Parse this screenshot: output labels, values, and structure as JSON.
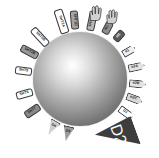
{
  "figure": {
    "center": {
      "name": "drug-molecule-sphere",
      "label": ""
    },
    "colors": {
      "outline": "#3a3a3a",
      "text": "#1a1a1a",
      "fill_white": "#ffffff",
      "fill_light": "#e8e8e8",
      "fill_mid": "#bdbdbd",
      "fill_dark": "#8f8f8f",
      "fill_darker": "#6e6e6e",
      "fill_black": "#4a4a4a",
      "sphere_center": "#ffffff",
      "sphere_edge": "#4a4a4a",
      "background": "#ffffff"
    },
    "receptors": [
      {
        "id": "r1",
        "label": "5HT2A",
        "shape": "tag",
        "fill": "#ffffff",
        "angle": -108,
        "dist": 60,
        "w": 25,
        "h": 9
      },
      {
        "id": "r2",
        "label": "5HT1A",
        "shape": "tag",
        "fill": "#b9b9b9",
        "angle": -78,
        "dist": 59,
        "w": 20,
        "h": 8
      },
      {
        "id": "r3",
        "label": "5HT1D",
        "shape": "tag",
        "fill": "#a3a3a3",
        "angle": -95,
        "dist": 59,
        "w": 19,
        "h": 8
      },
      {
        "id": "r4",
        "label": "M1",
        "shape": "tag",
        "fill": "#8f8f8f",
        "angle": -62,
        "dist": 58,
        "w": 13,
        "h": 8
      },
      {
        "id": "r5",
        "label": "H1",
        "shape": "tag",
        "fill": "#5a5a5a",
        "angle": -48,
        "dist": 58,
        "w": 12,
        "h": 8
      },
      {
        "id": "r6",
        "label": "5HT3B",
        "shape": "tag",
        "fill": "#ffffff",
        "angle": -133,
        "dist": 58,
        "w": 22,
        "h": 8
      },
      {
        "id": "r7",
        "label": "5HT2B",
        "shape": "tag",
        "fill": "#9a9a9a",
        "angle": -152,
        "dist": 57,
        "w": 19,
        "h": 8
      },
      {
        "id": "r8",
        "label": "5HT5",
        "shape": "tag",
        "fill": "#ffffff",
        "angle": -172,
        "dist": 57,
        "w": 17,
        "h": 8
      },
      {
        "id": "r9",
        "label": "5HT6",
        "shape": "tag",
        "fill": "#ffffff",
        "angle": 165,
        "dist": 57,
        "w": 17,
        "h": 8
      },
      {
        "id": "r10",
        "label": "5HT7",
        "shape": "tag",
        "fill": "#8a8a8a",
        "angle": 146,
        "dist": 57,
        "w": 17,
        "h": 8
      },
      {
        "id": "r11",
        "label": "D4",
        "shape": "spike",
        "fill": "#cfcfcf",
        "angle": 120,
        "dist": 56,
        "w": 11,
        "h": 15
      },
      {
        "id": "r12",
        "label": "D3",
        "shape": "spike",
        "fill": "#9d9d9d",
        "angle": 103,
        "dist": 56,
        "w": 11,
        "h": 15
      },
      {
        "id": "r13",
        "label": "D2",
        "shape": "bigtri",
        "fill": "#3d3d3d",
        "angle": 60,
        "dist": 62,
        "w": 30,
        "h": 40
      },
      {
        "id": "r14",
        "label": "D1",
        "shape": "arrow",
        "fill": "#ffffff",
        "angle": 36,
        "dist": 57,
        "w": 16,
        "h": 8
      },
      {
        "id": "r15",
        "label": "α2C",
        "shape": "arrow",
        "fill": "#d9d9d9",
        "angle": 20,
        "dist": 58,
        "w": 17,
        "h": 8
      },
      {
        "id": "r16",
        "label": "α2B",
        "shape": "arrow",
        "fill": "#e3e3e3",
        "angle": 5,
        "dist": 58,
        "w": 17,
        "h": 8
      },
      {
        "id": "r17",
        "label": "α2A",
        "shape": "arrow",
        "fill": "#e3e3e3",
        "angle": -12,
        "dist": 58,
        "w": 17,
        "h": 8
      },
      {
        "id": "r18",
        "label": "α1",
        "shape": "arrow",
        "fill": "#f0f0f0",
        "angle": -30,
        "dist": 57,
        "w": 14,
        "h": 8
      }
    ],
    "activation_icons": [
      {
        "id": "h1",
        "name": "hand-activation-icon-left",
        "x": 88,
        "y": 5,
        "w": 14,
        "h": 16,
        "fill": "#d0d0d0"
      },
      {
        "id": "h2",
        "name": "hand-activation-icon-right",
        "x": 105,
        "y": 9,
        "w": 13,
        "h": 15,
        "fill": "#d0d0d0"
      }
    ]
  }
}
